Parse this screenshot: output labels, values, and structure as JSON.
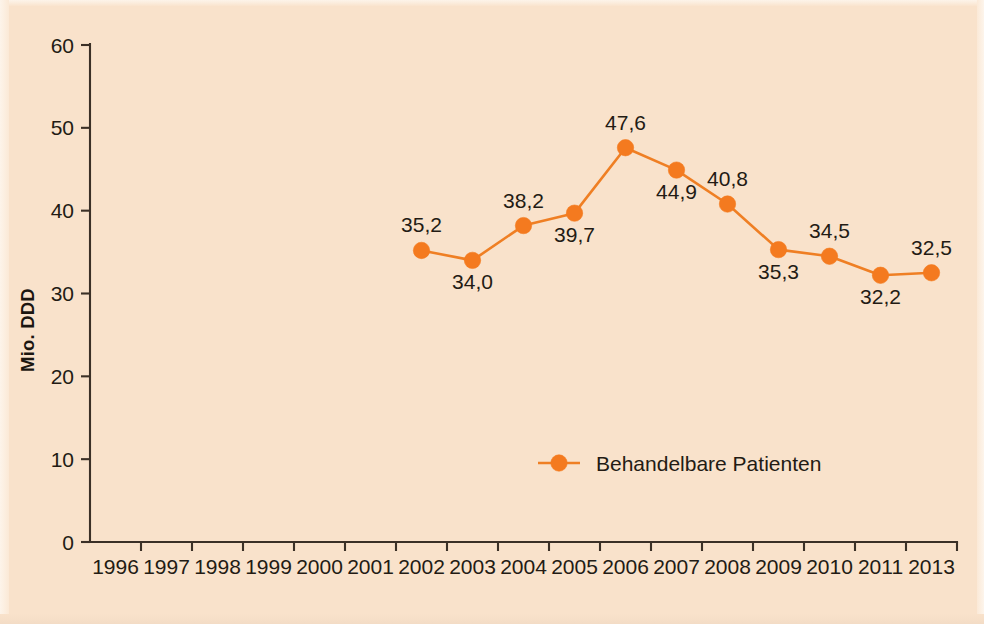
{
  "figure": {
    "background_color": "#f9e2cb",
    "series_color": "#f47a1f",
    "axis_color": "#3b3027",
    "text_color": "#231b14"
  },
  "chart_data": {
    "type": "line",
    "title": "",
    "subtitle": "",
    "xlabel": "",
    "ylabel": "Mio. DDD",
    "ylim": [
      0,
      60
    ],
    "ytick_labels": [
      "0",
      "10",
      "20",
      "30",
      "40",
      "50",
      "60"
    ],
    "ytick_values": [
      0,
      10,
      20,
      30,
      40,
      50,
      60
    ],
    "grid": false,
    "legend_position": "inside-bottom-center",
    "xtick_labels": [
      "1996",
      "1997",
      "1998",
      "1999",
      "2000",
      "2001",
      "2002",
      "2003",
      "2004",
      "2005",
      "2006",
      "2007",
      "2008",
      "2009",
      "2010",
      "2011",
      "2013"
    ],
    "series": [
      {
        "name": "Behandelbare Patienten",
        "x": [
          "2002",
          "2003",
          "2004",
          "2005",
          "2006",
          "2007",
          "2008",
          "2009",
          "2010",
          "2011",
          "2013"
        ],
        "values": [
          35.2,
          34.0,
          38.2,
          39.7,
          47.6,
          44.9,
          40.8,
          35.3,
          34.5,
          32.2,
          32.5
        ],
        "point_labels": [
          "35,2",
          "34,0",
          "38,2",
          "39,7",
          "47,6",
          "44,9",
          "40,8",
          "35,3",
          "34,5",
          "32,2",
          "32,5"
        ],
        "label_positions": [
          "above",
          "below",
          "above",
          "below",
          "above",
          "below",
          "above",
          "below",
          "above",
          "below",
          "above"
        ]
      }
    ]
  },
  "legend": {
    "entries": [
      {
        "label": "Behandelbare Patienten",
        "color": "#f47a1f",
        "marker": "circle"
      }
    ]
  }
}
